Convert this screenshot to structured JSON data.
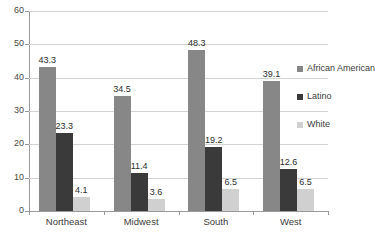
{
  "chart_data": {
    "type": "bar",
    "title": "",
    "subtitle": "",
    "xlabel": "",
    "ylabel": "",
    "categories": [
      "Northeast",
      "Midwest",
      "South",
      "West"
    ],
    "series": [
      {
        "name": "African American",
        "color": "#878787",
        "values": [
          43.3,
          34.5,
          48.3,
          39.1
        ]
      },
      {
        "name": "Latino",
        "color": "#3a3a3a",
        "values": [
          23.3,
          11.4,
          19.2,
          12.6
        ]
      },
      {
        "name": "White",
        "color": "#d0d0d0",
        "values": [
          4.1,
          3.6,
          6.5,
          6.5
        ]
      }
    ],
    "ylim": [
      0,
      60
    ],
    "yticks": [
      0,
      10,
      20,
      30,
      40,
      50,
      60
    ],
    "ytick_labels": [
      "0",
      "10",
      "20",
      "30",
      "40",
      "50",
      "60"
    ],
    "grid": true,
    "grid_axis": "y",
    "legend_position": "right",
    "data_labels": true,
    "data_labels_values": [
      [
        "43.3",
        "23.3",
        "4.1"
      ],
      [
        "34.5",
        "11.4",
        "3.6"
      ],
      [
        "48.3",
        "19.2",
        "6.5"
      ],
      [
        "39.1",
        "12.6",
        "6.5"
      ]
    ],
    "colors": {
      "gridline": "#d2d2d2",
      "axis": "#9a9a9a",
      "text": "#3b3b3b",
      "background": "#ffffff"
    }
  },
  "legend": {
    "items": [
      {
        "label": "African American"
      },
      {
        "label": "Latino"
      },
      {
        "label": "White"
      }
    ]
  }
}
